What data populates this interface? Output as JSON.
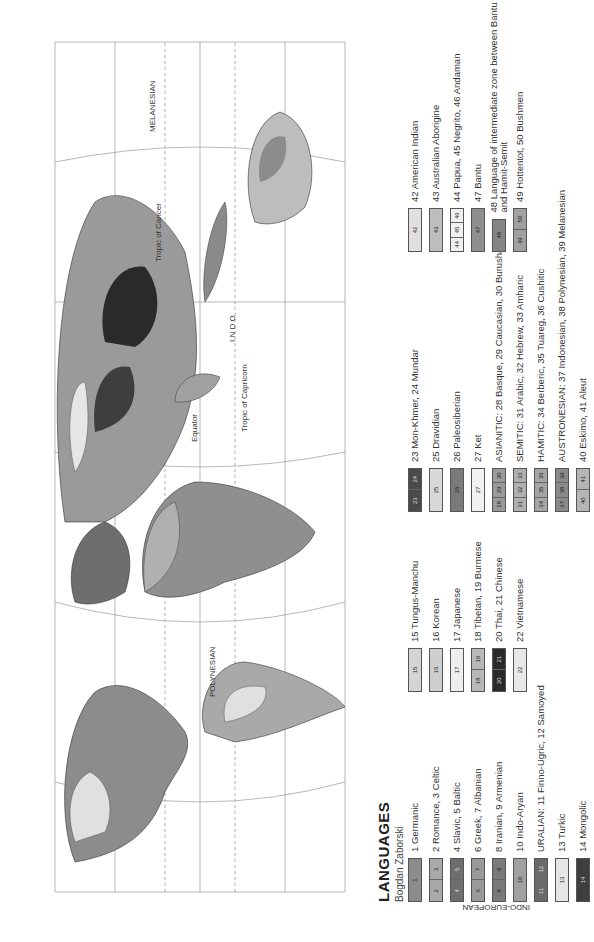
{
  "map": {
    "title": "LANGUAGES",
    "author": "Bogdan Zaborski",
    "labels": {
      "polynesian": "POLYNESIAN",
      "polynesian_num": "38",
      "melanesian": "MELANESIAN",
      "equator": "Equator",
      "tropic_cancer": "Tropic of Cancer",
      "tropic_capricorn": "Tropic of Capricorn",
      "indian_ocean": "I N D O"
    },
    "gridlines": [
      "40",
      "20",
      "0",
      "20",
      "40",
      "100 W",
      "80",
      "80 E",
      "140",
      "160",
      "180"
    ]
  },
  "legend": {
    "groups": {
      "indo_european": "INDO-EUROPEAN",
      "altaic_1": "ALTAIC",
      "altaic_2": "ALTAIC"
    },
    "columns": [
      [
        {
          "swatch": [
            "1"
          ],
          "label": "1 Germanic",
          "fill": "#8c8c8c"
        },
        {
          "swatch": [
            "2",
            "3"
          ],
          "label": "2 Romance, 3 Celtic",
          "fill": "#a9a9a9"
        },
        {
          "swatch": [
            "4",
            "5"
          ],
          "label": "4 Slavic, 5 Baltic",
          "fill": "#6e6e6e"
        },
        {
          "swatch": [
            "6",
            "7"
          ],
          "label": "6 Greek, 7 Albanian",
          "fill": "#9a9a9a"
        },
        {
          "swatch": [
            "8",
            "9"
          ],
          "label": "8 Iranian, 9 Armenian",
          "fill": "#7a7a7a"
        },
        {
          "swatch": [
            "10"
          ],
          "label": "10 Indo-Aryan",
          "fill": "#a0a0a0"
        },
        {
          "swatch": [
            "11",
            "12"
          ],
          "label": "URALIAN: 11 Finno-Ugric, 12 Samoyed",
          "fill": "#6a6a6a"
        },
        {
          "swatch": [
            "13"
          ],
          "label": "13 Turkic",
          "fill": "#e6e6e6"
        },
        {
          "swatch": [
            "14"
          ],
          "label": "14 Mongolic",
          "fill": "#3e3e3e"
        }
      ],
      [
        {
          "swatch": [
            "15"
          ],
          "label": "15 Tungus-Manchu",
          "fill": "#d5d5d5"
        },
        {
          "swatch": [
            "16"
          ],
          "label": "16 Korean",
          "fill": "#cfcfcf"
        },
        {
          "swatch": [
            "17"
          ],
          "label": "17 Japanese",
          "fill": "#eeeeee"
        },
        {
          "swatch": [
            "18",
            "19"
          ],
          "label": "18 Tibetan, 19 Burmese",
          "fill": "#b8b8b8"
        },
        {
          "swatch": [
            "20",
            "21"
          ],
          "label": "20 Thai, 21 Chinese",
          "fill": "#2a2a2a"
        },
        {
          "swatch": [
            "22"
          ],
          "label": "22 Vietnamese",
          "fill": "#e8e8e8"
        }
      ],
      [
        {
          "swatch": [
            "23",
            "24"
          ],
          "label": "23 Mon-Khmer, 24 Mundar",
          "fill": "#4a4a4a"
        },
        {
          "swatch": [
            "25"
          ],
          "label": "25 Dravidian",
          "fill": "#d8d8d8"
        },
        {
          "swatch": [
            "26"
          ],
          "label": "26 Paleosiberian",
          "fill": "#7a7a7a"
        },
        {
          "swatch": [
            "27"
          ],
          "label": "27 Ket",
          "fill": "#f2f2f2"
        },
        {
          "swatch": [
            "28",
            "29",
            "30"
          ],
          "label": "ASIANITIC: 28 Basque, 29 Caucasian, 30 Burushaski",
          "fill": "#9a9a9a"
        },
        {
          "swatch": [
            "31",
            "32",
            "33"
          ],
          "label": "SEMITIC: 31 Arabic, 32 Hebrew, 33 Amharic",
          "fill": "#b0b0b0"
        },
        {
          "swatch": [
            "34",
            "35",
            "36"
          ],
          "label": "HAMITIC: 34 Berberic, 35 Tuareg, 36 Cushitic",
          "fill": "#a5a5a5"
        },
        {
          "swatch": [
            "37",
            "38",
            "39"
          ],
          "label": "AUSTRONESIAN: 37 Indonesian, 38 Polynesian, 39 Melanesian",
          "fill": "#8a8a8a"
        },
        {
          "swatch": [
            "40",
            "41"
          ],
          "label": "40 Eskimo, 41 Aleut",
          "fill": "#b5b5b5"
        }
      ],
      [
        {
          "swatch": [
            "42"
          ],
          "label": "42 American Indian",
          "fill": "#e0e0e0"
        },
        {
          "swatch": [
            "43"
          ],
          "label": "43 Australian Aborigine",
          "fill": "#bdbdbd"
        },
        {
          "swatch": [
            "44",
            "45",
            "46"
          ],
          "label": "44 Papua, 45 Negrito, 46 Andaman",
          "fill": "#f0f0f0"
        },
        {
          "swatch": [
            "47"
          ],
          "label": "47 Bantu",
          "fill": "#8f8f8f"
        },
        {
          "swatch": [
            "48"
          ],
          "label": "48 Language of intermediate zone between Bantu and Hamit-Semit",
          "fill": "#858585"
        },
        {
          "swatch": [
            "49",
            "50"
          ],
          "label": "49 Hottentot, 50 Bushmen",
          "fill": "#a0a0a0"
        }
      ]
    ]
  }
}
